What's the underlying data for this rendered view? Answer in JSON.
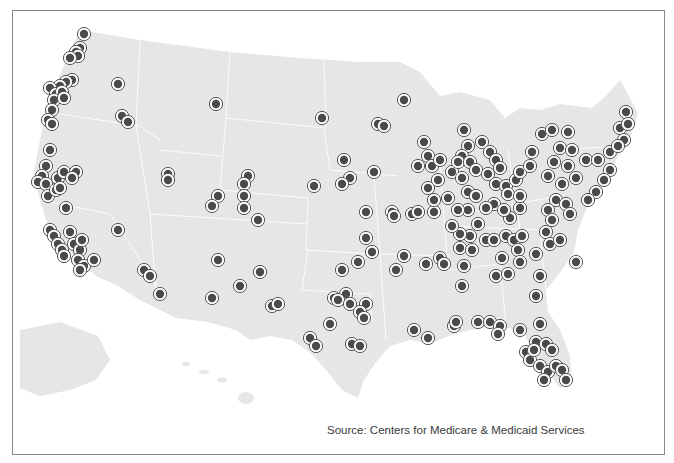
{
  "map": {
    "region": "United States",
    "land_color": "#e6e6e6",
    "border_color": "#ffffff",
    "marker": {
      "fill": "#4a4a4a",
      "ring": "#ffffff",
      "outline": "#555555",
      "radius": 4.2,
      "ring_radius": 6.6
    }
  },
  "source_text": "Source: Centers for Medicare & Medicaid Services",
  "markers": [
    [
      84,
      34
    ],
    [
      80,
      48
    ],
    [
      76,
      52
    ],
    [
      78,
      56
    ],
    [
      70,
      58
    ],
    [
      72,
      80
    ],
    [
      66,
      82
    ],
    [
      60,
      86
    ],
    [
      50,
      88
    ],
    [
      56,
      94
    ],
    [
      62,
      92
    ],
    [
      54,
      100
    ],
    [
      64,
      98
    ],
    [
      52,
      110
    ],
    [
      48,
      120
    ],
    [
      52,
      124
    ],
    [
      118,
      84
    ],
    [
      122,
      116
    ],
    [
      128,
      122
    ],
    [
      216,
      104
    ],
    [
      322,
      118
    ],
    [
      404,
      100
    ],
    [
      378,
      124
    ],
    [
      384,
      126
    ],
    [
      50,
      150
    ],
    [
      46,
      166
    ],
    [
      42,
      176
    ],
    [
      38,
      182
    ],
    [
      46,
      184
    ],
    [
      48,
      196
    ],
    [
      56,
      190
    ],
    [
      58,
      178
    ],
    [
      64,
      172
    ],
    [
      60,
      188
    ],
    [
      66,
      208
    ],
    [
      76,
      172
    ],
    [
      72,
      178
    ],
    [
      50,
      230
    ],
    [
      54,
      236
    ],
    [
      70,
      232
    ],
    [
      58,
      244
    ],
    [
      62,
      250
    ],
    [
      74,
      244
    ],
    [
      80,
      250
    ],
    [
      78,
      260
    ],
    [
      84,
      266
    ],
    [
      80,
      270
    ],
    [
      94,
      260
    ],
    [
      82,
      240
    ],
    [
      64,
      256
    ],
    [
      118,
      230
    ],
    [
      144,
      270
    ],
    [
      150,
      276
    ],
    [
      160,
      294
    ],
    [
      168,
      174
    ],
    [
      168,
      180
    ],
    [
      218,
      196
    ],
    [
      212,
      206
    ],
    [
      248,
      176
    ],
    [
      244,
      184
    ],
    [
      244,
      196
    ],
    [
      244,
      208
    ],
    [
      258,
      220
    ],
    [
      218,
      260
    ],
    [
      240,
      286
    ],
    [
      260,
      272
    ],
    [
      212,
      298
    ],
    [
      272,
      306
    ],
    [
      278,
      304
    ],
    [
      344,
      160
    ],
    [
      350,
      178
    ],
    [
      342,
      184
    ],
    [
      374,
      172
    ],
    [
      314,
      186
    ],
    [
      366,
      212
    ],
    [
      392,
      212
    ],
    [
      394,
      216
    ],
    [
      412,
      214
    ],
    [
      418,
      212
    ],
    [
      434,
      212
    ],
    [
      366,
      238
    ],
    [
      372,
      252
    ],
    [
      358,
      262
    ],
    [
      342,
      270
    ],
    [
      346,
      294
    ],
    [
      334,
      298
    ],
    [
      338,
      300
    ],
    [
      350,
      304
    ],
    [
      366,
      304
    ],
    [
      360,
      312
    ],
    [
      364,
      318
    ],
    [
      330,
      324
    ],
    [
      310,
      338
    ],
    [
      316,
      346
    ],
    [
      352,
      344
    ],
    [
      360,
      346
    ],
    [
      404,
      256
    ],
    [
      396,
      270
    ],
    [
      426,
      264
    ],
    [
      440,
      258
    ],
    [
      444,
      264
    ],
    [
      464,
      266
    ],
    [
      462,
      286
    ],
    [
      414,
      330
    ],
    [
      428,
      338
    ],
    [
      454,
      326
    ],
    [
      456,
      322
    ],
    [
      478,
      322
    ],
    [
      490,
      322
    ],
    [
      500,
      326
    ],
    [
      498,
      334
    ],
    [
      540,
      324
    ],
    [
      536,
      342
    ],
    [
      546,
      344
    ],
    [
      552,
      350
    ],
    [
      526,
      352
    ],
    [
      530,
      360
    ],
    [
      540,
      366
    ],
    [
      548,
      372
    ],
    [
      556,
      366
    ],
    [
      562,
      370
    ],
    [
      566,
      380
    ],
    [
      544,
      380
    ],
    [
      534,
      350
    ],
    [
      520,
      330
    ],
    [
      424,
      142
    ],
    [
      428,
      156
    ],
    [
      418,
      166
    ],
    [
      432,
      166
    ],
    [
      440,
      160
    ],
    [
      452,
      172
    ],
    [
      438,
      180
    ],
    [
      428,
      188
    ],
    [
      434,
      200
    ],
    [
      448,
      198
    ],
    [
      464,
      130
    ],
    [
      468,
      146
    ],
    [
      462,
      156
    ],
    [
      458,
      162
    ],
    [
      470,
      162
    ],
    [
      476,
      170
    ],
    [
      462,
      178
    ],
    [
      468,
      192
    ],
    [
      476,
      196
    ],
    [
      468,
      210
    ],
    [
      458,
      210
    ],
    [
      482,
      142
    ],
    [
      490,
      152
    ],
    [
      496,
      160
    ],
    [
      500,
      168
    ],
    [
      488,
      174
    ],
    [
      496,
      184
    ],
    [
      506,
      186
    ],
    [
      494,
      204
    ],
    [
      508,
      194
    ],
    [
      516,
      180
    ],
    [
      520,
      172
    ],
    [
      530,
      166
    ],
    [
      532,
      152
    ],
    [
      542,
      134
    ],
    [
      552,
      130
    ],
    [
      568,
      132
    ],
    [
      560,
      148
    ],
    [
      572,
      150
    ],
    [
      568,
      166
    ],
    [
      554,
      162
    ],
    [
      548,
      176
    ],
    [
      562,
      184
    ],
    [
      576,
      178
    ],
    [
      586,
      160
    ],
    [
      598,
      160
    ],
    [
      610,
      152
    ],
    [
      620,
      128
    ],
    [
      626,
      112
    ],
    [
      628,
      124
    ],
    [
      624,
      140
    ],
    [
      618,
      146
    ],
    [
      610,
      170
    ],
    [
      604,
      180
    ],
    [
      596,
      192
    ],
    [
      588,
      200
    ],
    [
      556,
      200
    ],
    [
      548,
      210
    ],
    [
      552,
      220
    ],
    [
      546,
      232
    ],
    [
      550,
      244
    ],
    [
      560,
      240
    ],
    [
      566,
      204
    ],
    [
      570,
      214
    ],
    [
      576,
      262
    ],
    [
      478,
      224
    ],
    [
      470,
      236
    ],
    [
      486,
      240
    ],
    [
      494,
      240
    ],
    [
      506,
      236
    ],
    [
      514,
      240
    ],
    [
      522,
      236
    ],
    [
      518,
      250
    ],
    [
      502,
      258
    ],
    [
      496,
      276
    ],
    [
      508,
      274
    ],
    [
      520,
      262
    ],
    [
      536,
      254
    ],
    [
      540,
      276
    ],
    [
      536,
      296
    ],
    [
      460,
      234
    ],
    [
      460,
      248
    ],
    [
      472,
      250
    ],
    [
      520,
      208
    ],
    [
      510,
      218
    ],
    [
      504,
      210
    ],
    [
      486,
      208
    ],
    [
      452,
      226
    ],
    [
      520,
      196
    ]
  ]
}
